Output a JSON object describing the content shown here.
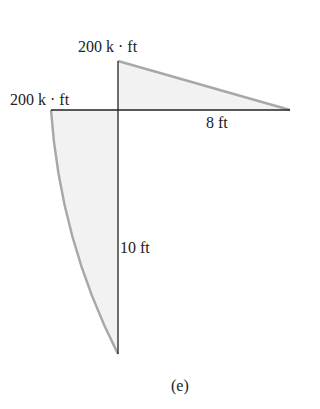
{
  "diagram": {
    "type": "moment diagram",
    "labels": {
      "top_moment": "200 k · ft",
      "left_moment": "200 k · ft",
      "horizontal_length": "8 ft",
      "vertical_length": "10 ft",
      "caption": "(e)"
    },
    "colors": {
      "frame_line": "#222222",
      "diagram_outline": "#a8a8a8",
      "diagram_fill": "#f2f2f2"
    }
  }
}
